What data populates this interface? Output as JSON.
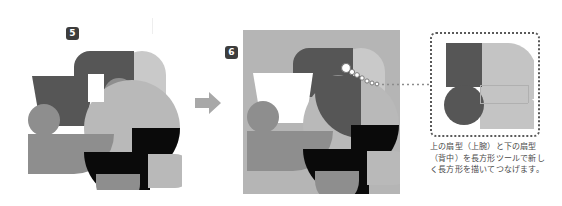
{
  "figure": {
    "background_color": "#ffffff"
  },
  "steps": [
    {
      "id": "step-5",
      "badge_label": "5",
      "badge_color": "#3d3d3d",
      "badge_text_color": "#ffffff",
      "canvas_background": "#ffffff",
      "description": "Bird character built from overlapping geometric shapes, shown on a white canvas."
    },
    {
      "id": "step-6",
      "badge_label": "6",
      "badge_color": "#3d3d3d",
      "badge_text_color": "#ffffff",
      "canvas_background": "#b5b5b5",
      "description": "Same bird character on a gray artboard with a new connecting rectangle and a selection path highlighted."
    }
  ],
  "flow": {
    "arrow_icon": "arrow-right-icon",
    "arrow_color": "#a8a8a8"
  },
  "callout": {
    "line_icon": "dotted-leader-icon",
    "line_color": "#8c8c8c",
    "handle_icon": "anchor-point-icon",
    "handle_color": "#ffffff",
    "detail_border_color": "#5a5a5a",
    "detail_border_style": "dotted"
  },
  "palette": {
    "dark_gray": "#565656",
    "mid_gray": "#8e8e8e",
    "light_gray": "#b9b9b9",
    "pale_gray": "#c9c9c9",
    "black": "#0a0a0a",
    "white": "#ffffff",
    "artboard_gray": "#b5b5b5",
    "guide_gray": "#eeeeee"
  },
  "caption": {
    "line1": "上の扇型（上腕）と下の扇型",
    "line2": "（背中）を長方形ツールで新し",
    "line3": "く長方形を描いてつなげます。"
  }
}
